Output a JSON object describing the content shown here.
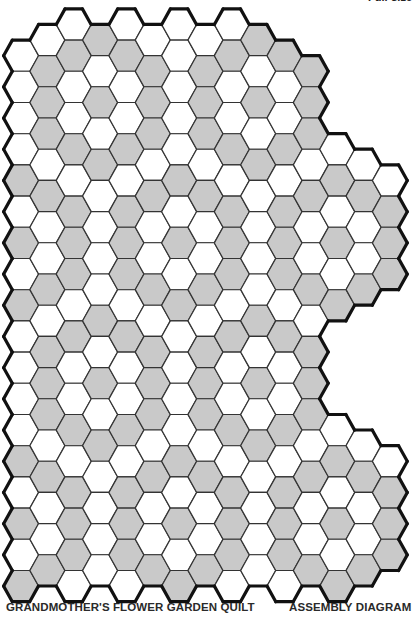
{
  "header": {
    "note": "Full-size"
  },
  "captions": {
    "title": "GRANDMOTHER'S FLOWER GARDEN QUILT",
    "subtitle": "ASSEMBLY DIAGRAM"
  },
  "colors": {
    "gray_fill": "#c9c9c9",
    "white_fill": "#ffffff",
    "line": "#333333",
    "border": "#111111"
  },
  "grid": {
    "x0": 21,
    "col_pitch": 26.35,
    "y0_even": 24.5,
    "y0_odd": 40,
    "row_pitch": 31.2,
    "half_width": 17.4,
    "patterns": {
      "A": "gwwwwgwgw",
      "B": "wgggwgwwg",
      "C": "wgwwgwggg",
      "D": "gwgwgwwww"
    },
    "columns": [
      {
        "col": 0,
        "type": "A",
        "ranges": [
          [
            1,
            18
          ]
        ]
      },
      {
        "col": 1,
        "type": "B",
        "ranges": [
          [
            0,
            17
          ]
        ]
      },
      {
        "col": 2,
        "type": "C",
        "ranges": [
          [
            0,
            18
          ]
        ]
      },
      {
        "col": 3,
        "type": "D",
        "ranges": [
          [
            0,
            17
          ]
        ]
      },
      {
        "col": 4,
        "type": "C",
        "ranges": [
          [
            0,
            18
          ]
        ]
      },
      {
        "col": 5,
        "type": "B",
        "ranges": [
          [
            0,
            17
          ]
        ]
      },
      {
        "col": 6,
        "type": "A",
        "ranges": [
          [
            0,
            18
          ]
        ],
        "overrides": {
          "0": "w"
        }
      },
      {
        "col": 7,
        "type": "B",
        "ranges": [
          [
            0,
            17
          ]
        ]
      },
      {
        "col": 8,
        "type": "C",
        "ranges": [
          [
            0,
            18
          ]
        ]
      },
      {
        "col": 9,
        "type": "D",
        "ranges": [
          [
            0,
            17
          ]
        ]
      },
      {
        "col": 10,
        "type": "C",
        "ranges": [
          [
            1,
            18
          ]
        ]
      },
      {
        "col": 11,
        "type": "B",
        "ranges": [
          [
            1,
            17
          ]
        ]
      },
      {
        "col": 12,
        "type": "A",
        "ranges": [
          [
            4,
            9
          ],
          [
            13,
            18
          ]
        ]
      },
      {
        "col": 13,
        "type": "B",
        "ranges": [
          [
            4,
            8
          ],
          [
            13,
            17
          ]
        ]
      },
      {
        "col": 14,
        "type": "C",
        "ranges": [
          [
            5,
            8
          ],
          [
            14,
            17
          ]
        ]
      }
    ]
  }
}
